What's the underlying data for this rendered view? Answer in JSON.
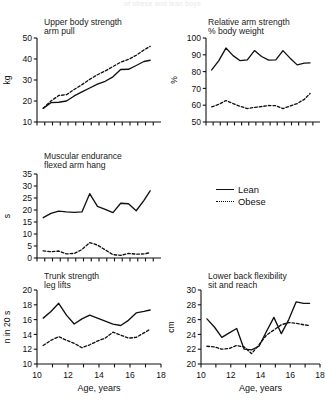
{
  "figure": {
    "suptitle": "of obese and lean boys",
    "legend": {
      "lean_label": "Lean",
      "obese_label": "Obese",
      "lean_style": "solid",
      "obese_style": "dotted"
    },
    "xlabel": "Age, years",
    "series_colors": {
      "lean": "#111111",
      "obese": "#111111"
    }
  },
  "chart_data": [
    {
      "type": "line",
      "panel": "upper-body-strength",
      "title": "Upper body strength",
      "subtitle": "arm pull",
      "xlabel": "",
      "ylabel": "kg",
      "xlim": [
        10,
        18
      ],
      "ylim": [
        10,
        50
      ],
      "yticks": [
        10,
        20,
        30,
        40,
        50
      ],
      "xticks": [
        10,
        10.5,
        11,
        11.5,
        12,
        12.5,
        13,
        13.5,
        14,
        14.5,
        15,
        15.5,
        16,
        16.5,
        17,
        17.5
      ],
      "xticklabels": [],
      "grid": false,
      "x": [
        10.4,
        10.9,
        11.4,
        11.9,
        12.4,
        12.9,
        13.4,
        13.9,
        14.4,
        14.9,
        15.4,
        15.9,
        16.4,
        16.9,
        17.3
      ],
      "series": [
        {
          "name": "Lean",
          "style": "solid",
          "values": [
            16.5,
            19.2,
            19.4,
            20.0,
            22.4,
            24.3,
            26.2,
            28.0,
            29.4,
            31.5,
            35.0,
            35.1,
            36.9,
            38.8,
            39.4
          ]
        },
        {
          "name": "Obese",
          "style": "dotted",
          "values": [
            16.6,
            20.0,
            22.6,
            23.0,
            25.5,
            27.8,
            30.3,
            32.5,
            34.3,
            36.4,
            38.5,
            39.8,
            41.8,
            44.3,
            46.0
          ]
        }
      ]
    },
    {
      "type": "line",
      "panel": "relative-arm-strength",
      "title": "Relative arm strength",
      "subtitle": "% body weight",
      "xlabel": "",
      "ylabel": "%",
      "xlim": [
        10,
        18
      ],
      "ylim": [
        50,
        100
      ],
      "yticks": [
        50,
        60,
        70,
        80,
        90,
        100
      ],
      "xticks": [
        10,
        10.5,
        11,
        11.5,
        12,
        12.5,
        13,
        13.5,
        14,
        14.5,
        15,
        15.5,
        16,
        16.5,
        17,
        17.5
      ],
      "xticklabels": [],
      "grid": false,
      "x": [
        10.4,
        10.9,
        11.4,
        11.9,
        12.4,
        12.9,
        13.4,
        13.9,
        14.4,
        14.9,
        15.4,
        15.9,
        16.4,
        16.9,
        17.3
      ],
      "series": [
        {
          "name": "Lean",
          "style": "solid",
          "values": [
            81.0,
            86.5,
            94.0,
            89.5,
            86.5,
            87.0,
            92.5,
            89.0,
            86.8,
            87.0,
            92.5,
            88.0,
            84.0,
            85.0,
            85.2
          ]
        },
        {
          "name": "Obese",
          "style": "dotted",
          "values": [
            59.0,
            60.5,
            62.8,
            61.0,
            59.3,
            58.0,
            58.7,
            59.2,
            59.8,
            59.7,
            58.0,
            59.5,
            61.0,
            63.5,
            67.0
          ]
        }
      ]
    },
    {
      "type": "line",
      "panel": "muscular-endurance",
      "title": "Muscular endurance",
      "subtitle": "flexed arm hang",
      "xlabel": "",
      "ylabel": "s",
      "xlim": [
        10,
        18
      ],
      "ylim": [
        0,
        35
      ],
      "yticks": [
        0,
        5,
        10,
        15,
        20,
        25,
        30,
        35
      ],
      "xticks": [
        10,
        10.5,
        11,
        11.5,
        12,
        12.5,
        13,
        13.5,
        14,
        14.5,
        15,
        15.5,
        16,
        16.5,
        17,
        17.5
      ],
      "xticklabels": [],
      "grid": false,
      "x": [
        10.4,
        10.9,
        11.4,
        11.9,
        12.4,
        12.9,
        13.4,
        13.9,
        14.4,
        14.9,
        15.4,
        15.9,
        16.4,
        16.9,
        17.3
      ],
      "series": [
        {
          "name": "Lean",
          "style": "solid",
          "values": [
            16.8,
            18.6,
            19.5,
            19.2,
            19.0,
            19.2,
            26.8,
            21.5,
            20.3,
            18.9,
            22.8,
            22.6,
            19.7,
            24.0,
            28.0
          ]
        },
        {
          "name": "Obese",
          "style": "dotted",
          "values": [
            3.0,
            2.6,
            2.9,
            1.7,
            1.9,
            3.5,
            6.4,
            5.4,
            3.4,
            1.4,
            1.1,
            1.9,
            1.6,
            1.7,
            2.2
          ]
        }
      ]
    },
    {
      "type": "line",
      "panel": "trunk-strength",
      "title": "Trunk strength",
      "subtitle": "leg lifts",
      "xlabel": "Age, years",
      "ylabel": "n in 20 s",
      "xlim": [
        10,
        18
      ],
      "ylim": [
        10,
        20
      ],
      "yticks": [
        10,
        12,
        14,
        16,
        18,
        20
      ],
      "xticks": [
        10,
        11,
        12,
        13,
        14,
        15,
        16,
        17,
        18
      ],
      "xticklabels": [
        "10",
        "12",
        "14",
        "16",
        "18"
      ],
      "grid": false,
      "x": [
        10.4,
        10.9,
        11.4,
        11.9,
        12.4,
        12.9,
        13.4,
        13.9,
        14.4,
        14.9,
        15.4,
        15.9,
        16.4,
        16.9,
        17.3
      ],
      "series": [
        {
          "name": "Lean",
          "style": "solid",
          "values": [
            16.2,
            17.1,
            18.2,
            16.6,
            15.4,
            16.1,
            16.6,
            16.2,
            15.8,
            15.4,
            15.2,
            15.9,
            16.9,
            17.1,
            17.3
          ]
        },
        {
          "name": "Obese",
          "style": "dotted",
          "values": [
            12.5,
            13.2,
            13.7,
            13.2,
            12.8,
            12.2,
            12.6,
            13.1,
            13.5,
            14.3,
            13.9,
            13.5,
            13.6,
            14.2,
            14.7
          ]
        }
      ]
    },
    {
      "type": "line",
      "panel": "lower-back-flexibility",
      "title": "Lower back flexibility",
      "subtitle": "sit and reach",
      "xlabel": "Age, years",
      "ylabel": "cm",
      "xlim": [
        10,
        18
      ],
      "ylim": [
        20,
        30
      ],
      "yticks": [
        20,
        22,
        24,
        26,
        28,
        30
      ],
      "xticks": [
        10,
        11,
        12,
        13,
        14,
        15,
        16,
        17,
        18
      ],
      "xticklabels": [
        "10",
        "12",
        "14",
        "16",
        "18"
      ],
      "grid": false,
      "x": [
        10.4,
        10.9,
        11.4,
        11.9,
        12.4,
        12.9,
        13.4,
        13.9,
        14.4,
        14.9,
        15.4,
        15.9,
        16.4,
        16.9,
        17.3
      ],
      "series": [
        {
          "name": "Lean",
          "style": "solid",
          "values": [
            26.1,
            25.0,
            23.6,
            24.2,
            24.8,
            22.0,
            21.9,
            22.4,
            24.4,
            26.3,
            24.1,
            26.0,
            28.4,
            28.2,
            28.2
          ]
        },
        {
          "name": "Obese",
          "style": "dotted",
          "values": [
            22.4,
            22.3,
            22.0,
            22.1,
            22.5,
            22.3,
            21.4,
            22.6,
            23.9,
            24.6,
            25.3,
            25.6,
            25.5,
            25.3,
            25.2
          ]
        }
      ]
    }
  ]
}
